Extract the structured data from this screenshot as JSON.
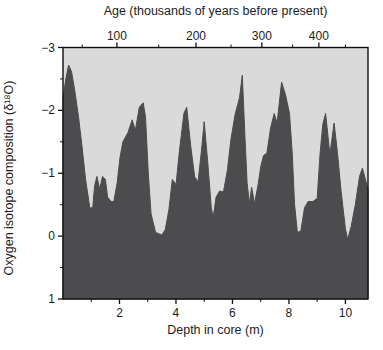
{
  "chart_data": {
    "type": "area",
    "title": "",
    "colors": {
      "area_fill": "#4c4c4e",
      "plot_background": "#dadada",
      "axis_line": "#111111",
      "page_background": "#ffffff",
      "text": "#1c1c1c"
    },
    "top_axis": {
      "label": "Age (thousands of years before present)",
      "ticks": [
        {
          "label": "100",
          "depth": 1.91
        },
        {
          "label": "200",
          "depth": 4.71
        },
        {
          "label": "300",
          "depth": 7.04
        },
        {
          "label": "400",
          "depth": 9.06
        }
      ],
      "minor_tick_depths": [
        0.68,
        3.39,
        5.95,
        8.13,
        10.0
      ]
    },
    "x_axis": {
      "label": "Depth in core (m)",
      "range": [
        0,
        10.8
      ],
      "major_ticks": [
        2,
        4,
        6,
        8,
        10
      ],
      "minor_ticks": [
        1,
        3,
        5,
        7,
        9
      ]
    },
    "y_axis": {
      "label": "Oxygen isotope composition (δ¹⁸O)",
      "range": [
        -3,
        1
      ],
      "inverted": true,
      "major_ticks": [
        -3,
        -2,
        -1,
        0,
        1
      ],
      "minor_ticks": [
        -2.5,
        -1.5,
        -0.5,
        0.5
      ]
    },
    "series": [
      {
        "name": "d18O record",
        "points": [
          [
            0.0,
            -2.2
          ],
          [
            0.1,
            -2.5
          ],
          [
            0.2,
            -2.72
          ],
          [
            0.3,
            -2.62
          ],
          [
            0.42,
            -2.3
          ],
          [
            0.55,
            -1.9
          ],
          [
            0.68,
            -1.4
          ],
          [
            0.8,
            -0.9
          ],
          [
            0.95,
            -0.45
          ],
          [
            1.05,
            -0.45
          ],
          [
            1.12,
            -0.8
          ],
          [
            1.2,
            -0.95
          ],
          [
            1.3,
            -0.75
          ],
          [
            1.4,
            -0.95
          ],
          [
            1.5,
            -0.9
          ],
          [
            1.58,
            -0.62
          ],
          [
            1.7,
            -0.55
          ],
          [
            1.8,
            -0.55
          ],
          [
            1.92,
            -0.85
          ],
          [
            2.02,
            -1.25
          ],
          [
            2.12,
            -1.5
          ],
          [
            2.3,
            -1.65
          ],
          [
            2.45,
            -1.85
          ],
          [
            2.56,
            -1.68
          ],
          [
            2.7,
            -2.05
          ],
          [
            2.84,
            -2.12
          ],
          [
            2.92,
            -1.9
          ],
          [
            3.02,
            -1.0
          ],
          [
            3.12,
            -0.35
          ],
          [
            3.28,
            -0.06
          ],
          [
            3.5,
            -0.02
          ],
          [
            3.62,
            -0.1
          ],
          [
            3.75,
            -0.42
          ],
          [
            3.87,
            -0.9
          ],
          [
            4.0,
            -0.82
          ],
          [
            4.12,
            -1.35
          ],
          [
            4.28,
            -1.95
          ],
          [
            4.38,
            -2.05
          ],
          [
            4.52,
            -1.45
          ],
          [
            4.66,
            -0.95
          ],
          [
            4.78,
            -0.86
          ],
          [
            4.9,
            -1.35
          ],
          [
            5.0,
            -1.82
          ],
          [
            5.12,
            -1.2
          ],
          [
            5.25,
            -0.45
          ],
          [
            5.32,
            -0.3
          ],
          [
            5.42,
            -0.62
          ],
          [
            5.55,
            -0.72
          ],
          [
            5.68,
            -0.7
          ],
          [
            5.82,
            -1.05
          ],
          [
            5.95,
            -1.55
          ],
          [
            6.1,
            -1.95
          ],
          [
            6.25,
            -2.2
          ],
          [
            6.35,
            -2.56
          ],
          [
            6.44,
            -1.6
          ],
          [
            6.52,
            -0.85
          ],
          [
            6.6,
            -0.52
          ],
          [
            6.68,
            -0.78
          ],
          [
            6.78,
            -0.52
          ],
          [
            6.9,
            -0.8
          ],
          [
            7.0,
            -1.1
          ],
          [
            7.1,
            -1.28
          ],
          [
            7.22,
            -1.32
          ],
          [
            7.35,
            -1.72
          ],
          [
            7.48,
            -1.95
          ],
          [
            7.58,
            -1.8
          ],
          [
            7.74,
            -2.45
          ],
          [
            7.88,
            -2.25
          ],
          [
            8.02,
            -1.95
          ],
          [
            8.12,
            -1.3
          ],
          [
            8.2,
            -0.5
          ],
          [
            8.3,
            -0.06
          ],
          [
            8.42,
            -0.08
          ],
          [
            8.55,
            -0.45
          ],
          [
            8.68,
            -0.55
          ],
          [
            8.85,
            -0.55
          ],
          [
            9.0,
            -0.6
          ],
          [
            9.1,
            -1.3
          ],
          [
            9.2,
            -1.78
          ],
          [
            9.3,
            -1.95
          ],
          [
            9.45,
            -1.3
          ],
          [
            9.6,
            -1.8
          ],
          [
            9.72,
            -1.32
          ],
          [
            9.85,
            -0.7
          ],
          [
            10.0,
            -0.12
          ],
          [
            10.08,
            0.05
          ],
          [
            10.2,
            -0.15
          ],
          [
            10.35,
            -0.5
          ],
          [
            10.5,
            -0.95
          ],
          [
            10.6,
            -1.08
          ],
          [
            10.8,
            -0.75
          ]
        ]
      }
    ],
    "layout": {
      "grid": false,
      "legend": "none"
    }
  }
}
